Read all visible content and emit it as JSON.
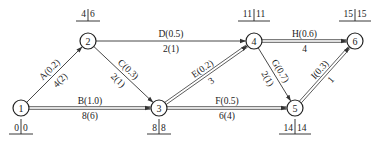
{
  "diagram": {
    "type": "activity-on-arrow network",
    "nodes": [
      {
        "id": "1",
        "x": 21,
        "y": 108,
        "times": [
          "0",
          "0"
        ],
        "times_pos": "below"
      },
      {
        "id": "2",
        "x": 88,
        "y": 41,
        "times": [
          "4",
          "6"
        ],
        "times_pos": "above"
      },
      {
        "id": "3",
        "x": 159,
        "y": 108,
        "times": [
          "8",
          "8"
        ],
        "times_pos": "below"
      },
      {
        "id": "4",
        "x": 254,
        "y": 41,
        "times": [
          "11",
          "11"
        ],
        "times_pos": "above"
      },
      {
        "id": "5",
        "x": 295,
        "y": 108,
        "times": [
          "14",
          "14"
        ],
        "times_pos": "below"
      },
      {
        "id": "6",
        "x": 355,
        "y": 41,
        "times": [
          "15",
          "15"
        ],
        "times_pos": "above"
      }
    ],
    "edges": [
      {
        "from": "1",
        "to": "2",
        "top": "A(0.2)",
        "bottom": "4(2)",
        "critical": false
      },
      {
        "from": "1",
        "to": "3",
        "top": "B(1.0)",
        "bottom": "8(6)",
        "critical": true
      },
      {
        "from": "2",
        "to": "3",
        "top": "C(0.3)",
        "bottom": "2(1)",
        "critical": false
      },
      {
        "from": "2",
        "to": "4",
        "top": "D(0.5)",
        "bottom": "2(1)",
        "critical": false
      },
      {
        "from": "3",
        "to": "4",
        "top": "E(0.2)",
        "bottom": "3",
        "critical": true
      },
      {
        "from": "3",
        "to": "5",
        "top": "F(0.5)",
        "bottom": "6(4)",
        "critical": true
      },
      {
        "from": "4",
        "to": "5",
        "top": "G(0.7)",
        "bottom": "2(1)",
        "critical": false
      },
      {
        "from": "4",
        "to": "6",
        "top": "H(0.6)",
        "bottom": "4",
        "critical": true
      },
      {
        "from": "5",
        "to": "6",
        "top": "I(0.3)",
        "bottom": "1",
        "critical": true
      }
    ]
  }
}
